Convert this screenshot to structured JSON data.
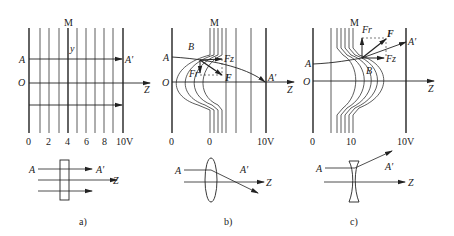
{
  "figure": {
    "panels": [
      {
        "id": "a",
        "caption": "a)",
        "electrode_label": "M",
        "labels": {
          "A": "A",
          "A_prime": "A′",
          "O": "O",
          "Z": "Z",
          "y": "y"
        },
        "ticks": [
          "0",
          "2",
          "4",
          "6",
          "8",
          "10V"
        ],
        "lens_type": "flat plate"
      },
      {
        "id": "b",
        "caption": "b)",
        "electrode_label": "M",
        "labels": {
          "A": "A",
          "A_prime": "A′",
          "O": "O",
          "Z": "Z",
          "B": "B",
          "F": "F",
          "Fr": "Fr",
          "Fz": "Fz"
        },
        "ticks": [
          "0",
          "0",
          "10V"
        ],
        "lens_type": "converging"
      },
      {
        "id": "c",
        "caption": "c)",
        "electrode_label": "M",
        "labels": {
          "A": "A",
          "A_prime": "A′",
          "O": "O",
          "Z": "Z",
          "B": "B",
          "F": "F",
          "Fr": "Fr",
          "Fz": "Fz"
        },
        "ticks": [
          "0",
          "10",
          "10V"
        ],
        "lens_type": "diverging"
      }
    ]
  }
}
